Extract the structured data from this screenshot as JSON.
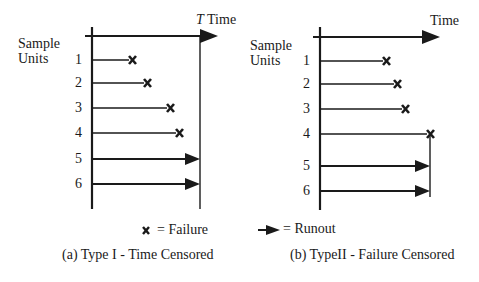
{
  "legend": {
    "failure_label": "= Failure",
    "runout_label": "= Runout",
    "failure_icon": "x-mark-icon",
    "runout_icon": "arrow-right-icon"
  },
  "panel_a": {
    "caption": "(a) Type I - Time Censored",
    "axis_label_y": [
      "Sample",
      "Units"
    ],
    "axis_label_x_symbol": "T",
    "axis_label_x": "Time",
    "units": [
      {
        "id": "1",
        "end": "failure"
      },
      {
        "id": "2",
        "end": "failure"
      },
      {
        "id": "3",
        "end": "failure"
      },
      {
        "id": "4",
        "end": "failure"
      },
      {
        "id": "5",
        "end": "runout"
      },
      {
        "id": "6",
        "end": "runout"
      }
    ]
  },
  "panel_b": {
    "caption": "(b) TypeII - Failure Censored",
    "axis_label_y": [
      "Sample",
      "Units"
    ],
    "axis_label_x": "Time",
    "units": [
      {
        "id": "1",
        "end": "failure"
      },
      {
        "id": "2",
        "end": "failure"
      },
      {
        "id": "3",
        "end": "failure"
      },
      {
        "id": "4",
        "end": "failure"
      },
      {
        "id": "5",
        "end": "runout"
      },
      {
        "id": "6",
        "end": "runout"
      }
    ]
  },
  "colors": {
    "ink": "#1a1a1a",
    "background": "#ffffff"
  }
}
